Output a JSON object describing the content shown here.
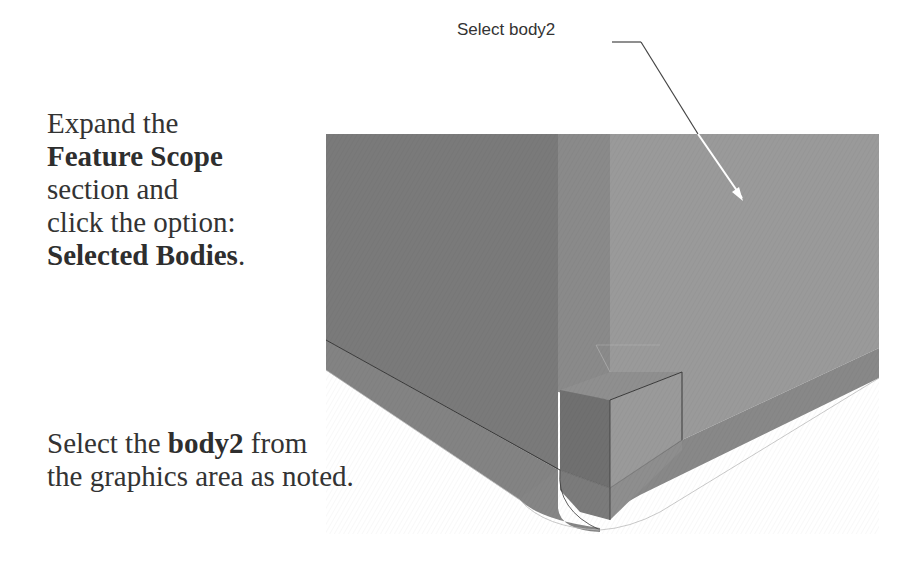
{
  "instructions": [
    {
      "lines": [
        {
          "text": "Expand the"
        },
        {
          "bold": "Feature Scope"
        },
        {
          "text": "section and"
        },
        {
          "text": "click the option:"
        },
        {
          "bold": "Selected Bodies",
          "suffix": "."
        }
      ]
    },
    {
      "lines": [
        {
          "prefix": "Select the ",
          "bold": "body2",
          "suffix": " from"
        },
        {
          "text": "the graphics area as noted."
        }
      ]
    }
  ],
  "callout": {
    "label": "Select body2",
    "target": "body2"
  },
  "model": {
    "colors": {
      "dark_face": "#7a7a7a",
      "light_face": "#999999",
      "mid_face": "#8c8c8c",
      "bottom_band": "#858585",
      "edge": "#3a3a3a",
      "arrow": "#ffffff"
    }
  }
}
